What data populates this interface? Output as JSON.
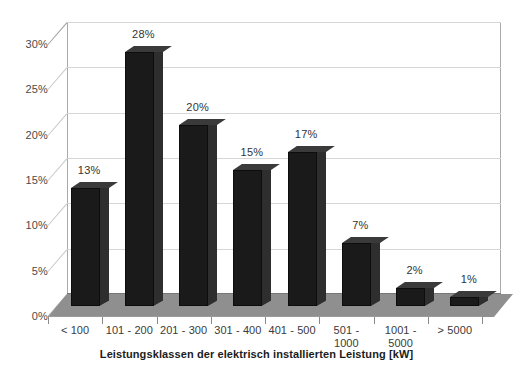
{
  "chart_data": {
    "type": "bar",
    "title": "",
    "subtitle": "",
    "xlabel": "Leistungsklassen der elektrisch installierten Leistung [kW]",
    "ylabel": "",
    "categories": [
      "< 100",
      "101 - 200",
      "201 - 300",
      "301 - 400",
      "401 - 500",
      "501 - 1000",
      "1001 - 5000",
      "> 5000"
    ],
    "values": [
      13,
      28,
      20,
      15,
      17,
      7,
      2,
      1
    ],
    "data_labels": [
      "13%",
      "28%",
      "20%",
      "15%",
      "17%",
      "7%",
      "2%",
      "1%"
    ],
    "ylim": [
      0,
      30
    ],
    "ytick_values": [
      0,
      5,
      10,
      15,
      20,
      25,
      30
    ],
    "ytick_labels": [
      "0%",
      "5%",
      "10%",
      "15%",
      "20%",
      "25%",
      "30%"
    ],
    "grid": true,
    "legend": false,
    "style": "3d-column",
    "bar_color": "#1a1a1a",
    "floor_color": "#8f8f8f",
    "gridline_color": "#d6d6d6",
    "plot_background": "#ffffff"
  }
}
